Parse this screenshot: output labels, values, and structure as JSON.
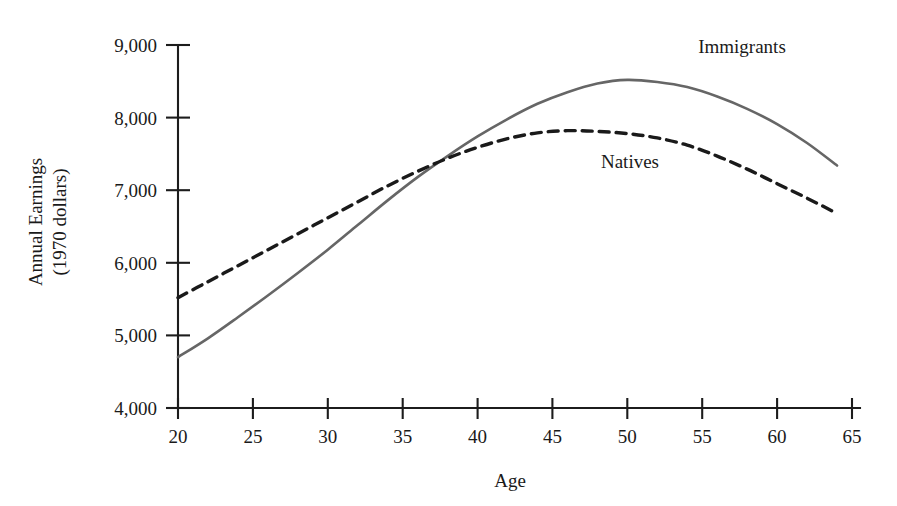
{
  "figure": {
    "background_color": "#ffffff",
    "axis_color": "#1c1c1c"
  },
  "axis_titles": {
    "x": "Age",
    "y_line1": "Annual Earnings",
    "y_line2": "(1970 dollars)"
  },
  "series_labels": {
    "immigrants": "Immigrants",
    "natives": "Natives"
  },
  "chart_data": {
    "type": "line",
    "title": "",
    "subtitle": "",
    "xlabel": "Age",
    "ylabel": "Annual Earnings (1970 dollars)",
    "xlim": [
      20,
      65
    ],
    "ylim": [
      4000,
      9000
    ],
    "xticks": [
      20,
      25,
      30,
      35,
      40,
      45,
      50,
      55,
      60,
      65
    ],
    "xticklabels": [
      "20",
      "25",
      "30",
      "35",
      "40",
      "45",
      "50",
      "55",
      "60",
      "65"
    ],
    "yticks": [
      4000,
      5000,
      6000,
      7000,
      8000,
      9000
    ],
    "yticklabels": [
      "4,000",
      "5,000",
      "6,000",
      "7,000",
      "8,000",
      "9,000"
    ],
    "grid": false,
    "legend": "inline-annotations",
    "annotations": [
      {
        "text": "Immigrants",
        "x": 62.0,
        "y": 8830
      },
      {
        "text": "Natives",
        "x": 52.5,
        "y": 7430
      }
    ],
    "series": [
      {
        "name": "Immigrants",
        "color": "#666666",
        "linestyle": "solid",
        "linewidth": 2.6,
        "x": [
          20,
          22,
          24,
          26,
          28,
          30,
          32,
          34,
          36,
          38,
          40,
          42,
          44,
          46,
          48,
          50,
          52,
          54,
          56,
          58,
          60,
          62,
          64
        ],
        "y": [
          4700,
          4960,
          5250,
          5550,
          5860,
          6180,
          6520,
          6860,
          7180,
          7470,
          7740,
          7980,
          8190,
          8350,
          8470,
          8520,
          8490,
          8420,
          8290,
          8120,
          7910,
          7650,
          7340
        ]
      },
      {
        "name": "Natives",
        "color": "#1a1a1a",
        "linestyle": "dashed",
        "linewidth": 3.4,
        "dash_pattern": "10 7",
        "x": [
          20,
          22,
          24,
          26,
          28,
          30,
          32,
          34,
          36,
          38,
          40,
          42,
          44,
          46,
          48,
          50,
          52,
          54,
          56,
          58,
          60,
          62,
          64
        ],
        "y": [
          5520,
          5740,
          5960,
          6180,
          6400,
          6620,
          6840,
          7060,
          7260,
          7440,
          7590,
          7710,
          7790,
          7820,
          7810,
          7780,
          7720,
          7620,
          7470,
          7290,
          7090,
          6890,
          6680
        ]
      }
    ],
    "notes": {
      "crossover_age": 34,
      "crossover_value": 7150,
      "immigrants_peak_age": 49,
      "immigrants_peak_value": 8520,
      "natives_peak_age": 46,
      "natives_peak_value": 7820
    }
  }
}
